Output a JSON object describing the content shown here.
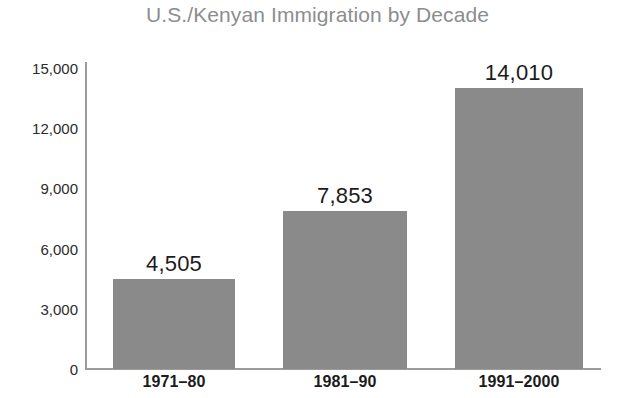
{
  "chart_data": {
    "type": "bar",
    "title": "U.S./Kenyan Immigration by Decade",
    "xlabel": "",
    "ylabel": "",
    "categories": [
      "1971–80",
      "1981–90",
      "1991–2000"
    ],
    "values": [
      4505,
      7853,
      14010
    ],
    "value_labels": [
      "4,505",
      "7,853",
      "14,010"
    ],
    "ylim": [
      0,
      15000
    ],
    "yticks": [
      0,
      3000,
      6000,
      9000,
      12000,
      15000
    ],
    "ytick_labels": [
      "0",
      "3,000",
      "6,000",
      "9,000",
      "12,000",
      "15,000"
    ],
    "grid": false,
    "legend": false,
    "legend_position": "none",
    "bar_color": "#8a8a8a",
    "title_color": "#8d8d8d",
    "axis_color": "#9b9b9b",
    "label_color": "#1c1c1c",
    "background_color": "#ffffff"
  }
}
